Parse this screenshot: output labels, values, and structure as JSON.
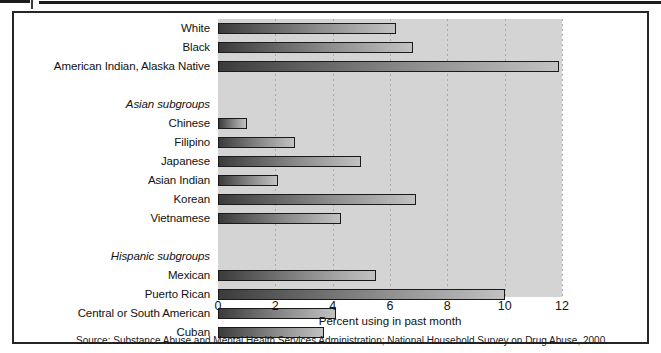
{
  "figure": {
    "axis_title": "Percent using in past month",
    "source_note": "Source: Substance Abuse and Mental Health Services Administration; National Household Survey on Drug Abuse, 2000.",
    "plot_background": "#d4d4d4",
    "bar_outline": "#1a1a1a",
    "frame_color": "#262626"
  },
  "chart_data": {
    "type": "bar",
    "orientation": "horizontal",
    "title": "",
    "subtitle": "",
    "xlabel": "Percent using in past month",
    "ylabel": "",
    "xlim": [
      0,
      12
    ],
    "ylim": null,
    "grid": "vertical-dotted",
    "legend": "none",
    "xticks": [
      0,
      2,
      4,
      6,
      8,
      10,
      12
    ],
    "xtick_labels": [
      "0",
      "2",
      "4",
      "6",
      "8",
      "10",
      "12"
    ],
    "categories": [
      "White",
      "Black",
      "American Indian, Alaska Native",
      "Asian subgroups",
      "Chinese",
      "Filipino",
      "Japanese",
      "Asian Indian",
      "Korean",
      "Vietnamese",
      "Hispanic subgroups",
      "Mexican",
      "Puerto Rican",
      "Central or South American",
      "Cuban"
    ],
    "values": [
      6.2,
      6.8,
      11.9,
      null,
      1.0,
      2.7,
      5.0,
      2.1,
      6.9,
      4.3,
      null,
      5.5,
      10.0,
      4.1,
      3.7
    ],
    "group_headers": [
      "Asian subgroups",
      "Hispanic subgroups"
    ],
    "rows": [
      {
        "label": "White",
        "value": 6.2,
        "is_group": false
      },
      {
        "label": "Black",
        "value": 6.8,
        "is_group": false
      },
      {
        "label": "American Indian,  Alaska Native",
        "value": 11.9,
        "is_group": false
      },
      {
        "label": "",
        "value": null,
        "is_group": false
      },
      {
        "label": "Asian subgroups",
        "value": null,
        "is_group": true
      },
      {
        "label": "Chinese",
        "value": 1.0,
        "is_group": false
      },
      {
        "label": "Filipino",
        "value": 2.7,
        "is_group": false
      },
      {
        "label": "Japanese",
        "value": 5.0,
        "is_group": false
      },
      {
        "label": "Asian Indian",
        "value": 2.1,
        "is_group": false
      },
      {
        "label": "Korean",
        "value": 6.9,
        "is_group": false
      },
      {
        "label": "Vietnamese",
        "value": 4.3,
        "is_group": false
      },
      {
        "label": "",
        "value": null,
        "is_group": false
      },
      {
        "label": "Hispanic subgroups",
        "value": null,
        "is_group": true
      },
      {
        "label": "Mexican",
        "value": 5.5,
        "is_group": false
      },
      {
        "label": "Puerto Rican",
        "value": 10.0,
        "is_group": false
      },
      {
        "label": "Central or South American",
        "value": 4.1,
        "is_group": false
      },
      {
        "label": "Cuban",
        "value": 3.7,
        "is_group": false
      }
    ]
  }
}
